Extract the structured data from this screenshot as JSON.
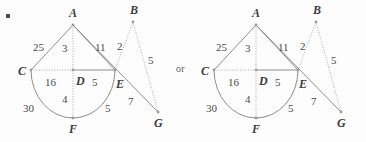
{
  "figure": {
    "bullet": "•",
    "connector_word": "or",
    "diagrams": [
      {
        "id": "left-diagram",
        "points": [
          {
            "name": "A",
            "label": "A",
            "x": 73,
            "y": 25,
            "lx": 69,
            "ly": 17
          },
          {
            "name": "B",
            "label": "B",
            "x": 133,
            "y": 22,
            "lx": 130,
            "ly": 14
          },
          {
            "name": "C",
            "label": "C",
            "x": 31,
            "y": 70,
            "lx": 21,
            "ly": 74
          },
          {
            "name": "D",
            "label": "D",
            "x": 73,
            "y": 70,
            "lx": 76,
            "ly": 84
          },
          {
            "name": "E",
            "label": "E",
            "x": 115,
            "y": 70,
            "lx": 116,
            "ly": 87
          },
          {
            "name": "F",
            "label": "F",
            "x": 73,
            "y": 118,
            "lx": 69,
            "ly": 132
          },
          {
            "name": "G",
            "label": "G",
            "x": 158,
            "y": 112,
            "lx": 155,
            "ly": 126
          }
        ],
        "edge_labels": [
          {
            "name": "len-CA",
            "value": "25",
            "x": 40,
            "y": 48
          },
          {
            "name": "len-AD",
            "value": "3",
            "x": 65,
            "y": 50
          },
          {
            "name": "len-AE",
            "value": "11",
            "x": 98,
            "y": 48
          },
          {
            "name": "len-AB",
            "value": "2",
            "x": 119,
            "y": 47
          },
          {
            "name": "len-BG",
            "value": "5",
            "x": 149,
            "y": 62
          },
          {
            "name": "len-CD",
            "value": "16",
            "x": 49,
            "y": 84
          },
          {
            "name": "len-DE",
            "value": "5",
            "x": 93,
            "y": 84
          },
          {
            "name": "len-DF",
            "value": "4",
            "x": 64,
            "y": 101
          },
          {
            "name": "len-arc-CF",
            "value": "30",
            "x": 28,
            "y": 110
          },
          {
            "name": "len-FE",
            "value": "5",
            "x": 107,
            "y": 110
          },
          {
            "name": "len-EG",
            "value": "7",
            "x": 131,
            "y": 103
          }
        ]
      },
      {
        "id": "right-diagram",
        "points": [
          {
            "name": "A",
            "label": "A",
            "x": 73,
            "y": 25,
            "lx": 69,
            "ly": 17
          },
          {
            "name": "B",
            "label": "B",
            "x": 133,
            "y": 22,
            "lx": 130,
            "ly": 14
          },
          {
            "name": "C",
            "label": "C",
            "x": 31,
            "y": 70,
            "lx": 21,
            "ly": 74
          },
          {
            "name": "D",
            "label": "D",
            "x": 73,
            "y": 70,
            "lx": 76,
            "ly": 84
          },
          {
            "name": "E",
            "label": "E",
            "x": 115,
            "y": 70,
            "lx": 116,
            "ly": 87
          },
          {
            "name": "F",
            "label": "F",
            "x": 73,
            "y": 118,
            "lx": 69,
            "ly": 132
          },
          {
            "name": "G",
            "label": "G",
            "x": 158,
            "y": 112,
            "lx": 155,
            "ly": 126
          }
        ],
        "edge_labels": [
          {
            "name": "len-CA",
            "value": "25",
            "x": 40,
            "y": 48
          },
          {
            "name": "len-AD",
            "value": "3",
            "x": 65,
            "y": 50
          },
          {
            "name": "len-AE",
            "value": "11",
            "x": 98,
            "y": 48
          },
          {
            "name": "len-AB",
            "value": "2",
            "x": 119,
            "y": 47
          },
          {
            "name": "len-BG",
            "value": "5",
            "x": 149,
            "y": 62
          },
          {
            "name": "len-CD",
            "value": "16",
            "x": 49,
            "y": 84
          },
          {
            "name": "len-DE",
            "value": "5",
            "x": 93,
            "y": 84
          },
          {
            "name": "len-DF",
            "value": "4",
            "x": 64,
            "y": 101
          },
          {
            "name": "len-arc-CF",
            "value": "30",
            "x": 28,
            "y": 110
          },
          {
            "name": "len-FE",
            "value": "5",
            "x": 107,
            "y": 110
          },
          {
            "name": "len-EG",
            "value": "7",
            "x": 131,
            "y": 103
          }
        ]
      }
    ]
  },
  "colors": {
    "stroke": "#8e8e8e",
    "stroke_light": "#a8a8a8",
    "text": "#4a4a4a",
    "label": "#3d3d3d",
    "background": "#fdfdfd"
  }
}
